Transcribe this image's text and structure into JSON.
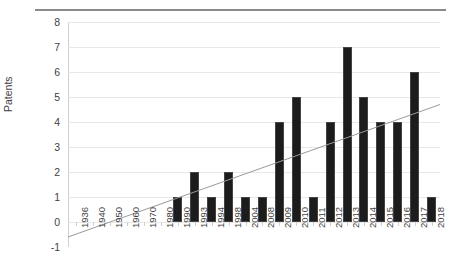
{
  "chart_data": {
    "type": "bar",
    "title": "",
    "xlabel": "",
    "ylabel": "Patents",
    "ylim": [
      -1,
      8
    ],
    "yticks": [
      8,
      7,
      6,
      5,
      4,
      3,
      2,
      1,
      0,
      -1
    ],
    "grid": true,
    "legend": null,
    "categories": [
      "1936",
      "1940",
      "1950",
      "1960",
      "1970",
      "1980",
      "1990",
      "1993",
      "1994",
      "1998",
      "2004",
      "2008",
      "2009",
      "2010",
      "2011",
      "2012",
      "2013",
      "2014",
      "2015",
      "2016",
      "2017",
      "2018"
    ],
    "values": [
      0,
      0,
      0,
      0,
      0,
      0,
      1,
      2,
      1,
      2,
      1,
      1,
      4,
      5,
      1,
      4,
      7,
      5,
      4,
      4,
      6,
      1
    ],
    "series": [
      {
        "name": "Patents",
        "values": [
          0,
          0,
          0,
          0,
          0,
          0,
          1,
          2,
          1,
          2,
          1,
          1,
          4,
          5,
          1,
          4,
          7,
          5,
          4,
          4,
          6,
          1
        ],
        "color": "#1c1c1c"
      },
      {
        "name": "Linear trend",
        "type": "line",
        "color": "#9a9a9a",
        "start_value": -0.6,
        "end_value": 4.7
      }
    ],
    "annotations": [],
    "colors": {
      "bar": "#1c1c1c",
      "bar_edge": "#444444",
      "trendline": "#9a9a9a",
      "gridline": "#e8e8e8",
      "axis": "#d0d0d0",
      "top_rule": "#8a8a8a",
      "text": "#3f3f3f",
      "background": "#ffffff"
    }
  }
}
